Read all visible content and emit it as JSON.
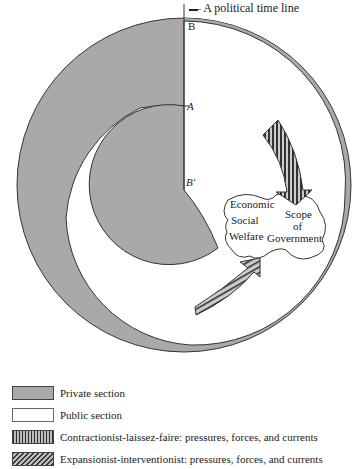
{
  "diagram": {
    "timeline_label": "A political time line",
    "points": {
      "b": "B",
      "a": "A",
      "b_prime": "B′"
    },
    "cloud_text": {
      "left": [
        "Economic",
        "Social",
        "Welfare"
      ],
      "right": [
        "Scope",
        "of",
        "Government"
      ]
    },
    "colors": {
      "private": "#a9a9a9",
      "public": "#ffffff",
      "outline": "#333333"
    }
  },
  "legend": {
    "items": [
      {
        "key": "private",
        "label": "Private section"
      },
      {
        "key": "public",
        "label": "Public section"
      },
      {
        "key": "contractionist",
        "label": "Contractionist-laissez-faire: pressures, forces, and currents"
      },
      {
        "key": "expansionist",
        "label": "Expansionist-interventionist: pressures, forces, and currents"
      }
    ]
  }
}
